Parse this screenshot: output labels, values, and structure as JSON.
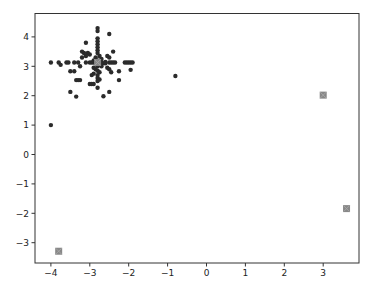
{
  "chart_data": {
    "type": "scatter",
    "title": "",
    "xlabel": "",
    "ylabel": "",
    "xlim": [
      -4.4,
      3.9
    ],
    "ylim": [
      -3.7,
      4.7
    ],
    "grid": false,
    "legend": null,
    "x_ticks": [
      -4,
      -3,
      -2,
      -1,
      0,
      1,
      2,
      3
    ],
    "y_ticks": [
      -3,
      -2,
      -1,
      0,
      1,
      2,
      3,
      4
    ],
    "x_tick_labels": [
      "−4",
      "−3",
      "−2",
      "−1",
      "0",
      "1",
      "2",
      "3"
    ],
    "y_tick_labels": [
      "−3",
      "−2",
      "−1",
      "0",
      "1",
      "2",
      "3",
      "4"
    ],
    "series": [
      {
        "name": "points",
        "marker": "circle",
        "color": "#2b2b2b",
        "points": [
          [
            -2.8,
            4.3
          ],
          [
            -2.8,
            4.2
          ],
          [
            -2.5,
            4.1
          ],
          [
            -2.8,
            3.95
          ],
          [
            -2.8,
            3.85
          ],
          [
            -2.8,
            3.75
          ],
          [
            -3.1,
            3.8
          ],
          [
            -2.8,
            3.65
          ],
          [
            -2.8,
            3.55
          ],
          [
            -3.2,
            3.5
          ],
          [
            -3.15,
            3.45
          ],
          [
            -3.05,
            3.45
          ],
          [
            -3.0,
            3.4
          ],
          [
            -3.1,
            3.35
          ],
          [
            -3.2,
            3.3
          ],
          [
            -2.4,
            3.5
          ],
          [
            -2.55,
            3.35
          ],
          [
            -2.5,
            3.3
          ],
          [
            -2.8,
            3.45
          ],
          [
            -2.75,
            3.35
          ],
          [
            -2.85,
            3.3
          ],
          [
            -2.8,
            3.2
          ],
          [
            -2.7,
            3.25
          ],
          [
            -2.9,
            3.2
          ],
          [
            -2.6,
            3.15
          ],
          [
            -2.65,
            3.1
          ],
          [
            -4.0,
            3.13
          ],
          [
            -3.8,
            3.13
          ],
          [
            -3.75,
            3.05
          ],
          [
            -3.6,
            3.13
          ],
          [
            -3.55,
            3.13
          ],
          [
            -3.4,
            3.13
          ],
          [
            -3.3,
            3.13
          ],
          [
            -3.1,
            3.13
          ],
          [
            -3.0,
            3.13
          ],
          [
            -2.95,
            3.13
          ],
          [
            -2.9,
            3.13
          ],
          [
            -2.85,
            3.13
          ],
          [
            -2.75,
            3.13
          ],
          [
            -2.7,
            3.13
          ],
          [
            -2.6,
            3.1
          ],
          [
            -2.5,
            3.13
          ],
          [
            -2.45,
            3.13
          ],
          [
            -2.4,
            3.13
          ],
          [
            -2.35,
            3.13
          ],
          [
            -2.1,
            3.13
          ],
          [
            -2.05,
            3.13
          ],
          [
            -2.0,
            3.13
          ],
          [
            -1.95,
            3.13
          ],
          [
            -1.9,
            3.13
          ],
          [
            -3.25,
            3.0
          ],
          [
            -2.8,
            3.0
          ],
          [
            -2.9,
            2.95
          ],
          [
            -2.7,
            3.0
          ],
          [
            -2.55,
            2.95
          ],
          [
            -2.5,
            2.9
          ],
          [
            -1.95,
            2.88
          ],
          [
            -3.5,
            2.83
          ],
          [
            -3.4,
            2.83
          ],
          [
            -2.85,
            2.9
          ],
          [
            -2.8,
            2.85
          ],
          [
            -2.75,
            2.8
          ],
          [
            -2.45,
            2.8
          ],
          [
            -2.25,
            2.83
          ],
          [
            -2.9,
            2.75
          ],
          [
            -2.8,
            2.7
          ],
          [
            -2.95,
            2.7
          ],
          [
            -2.8,
            2.6
          ],
          [
            -2.75,
            2.55
          ],
          [
            -3.35,
            2.53
          ],
          [
            -3.3,
            2.53
          ],
          [
            -3.25,
            2.53
          ],
          [
            -2.8,
            2.5
          ],
          [
            -2.25,
            2.53
          ],
          [
            -3.0,
            2.4
          ],
          [
            -2.95,
            2.4
          ],
          [
            -2.9,
            2.4
          ],
          [
            -2.8,
            2.27
          ],
          [
            -3.5,
            2.13
          ],
          [
            -2.5,
            2.13
          ],
          [
            -3.35,
            1.97
          ],
          [
            -2.65,
            1.98
          ],
          [
            -0.8,
            2.67
          ],
          [
            -4.0,
            1.0
          ]
        ]
      },
      {
        "name": "centroids",
        "marker": "square-x",
        "color": "#888888",
        "points": [
          [
            -2.8,
            3.13
          ],
          [
            3.0,
            2.02
          ],
          [
            3.6,
            -1.84
          ],
          [
            -3.8,
            -3.29
          ]
        ]
      }
    ]
  }
}
